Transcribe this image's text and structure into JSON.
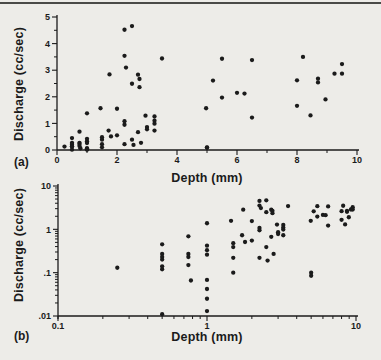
{
  "page": {
    "background": "#edece8",
    "ink": "#1b1b1b",
    "top_rule_color": "#4a4a47"
  },
  "measurements": [
    [
      0.25,
      0.13
    ],
    [
      0.5,
      0.45
    ],
    [
      0.5,
      0.27
    ],
    [
      0.5,
      0.23
    ],
    [
      0.5,
      0.2
    ],
    [
      0.5,
      0.14
    ],
    [
      0.5,
      0.12
    ],
    [
      0.5,
      0.011
    ],
    [
      0.75,
      0.69
    ],
    [
      0.75,
      0.27
    ],
    [
      0.75,
      0.23
    ],
    [
      0.75,
      0.15
    ],
    [
      0.78,
      0.066
    ],
    [
      1,
      1.38
    ],
    [
      1,
      0.42
    ],
    [
      1,
      0.33
    ],
    [
      1,
      0.26
    ],
    [
      1,
      0.068
    ],
    [
      1,
      0.042
    ],
    [
      1,
      0.025
    ],
    [
      1,
      0.013
    ],
    [
      1.45,
      1.57
    ],
    [
      1.5,
      0.48
    ],
    [
      1.5,
      0.39
    ],
    [
      1.5,
      0.22
    ],
    [
      1.5,
      0.1
    ],
    [
      1.75,
      2.84
    ],
    [
      1.72,
      0.73
    ],
    [
      1.8,
      0.51
    ],
    [
      2,
      1.55
    ],
    [
      2,
      0.55
    ],
    [
      2.25,
      4.52
    ],
    [
      2.25,
      3.54
    ],
    [
      2.3,
      3.1
    ],
    [
      2.25,
      1.08
    ],
    [
      2.25,
      0.95
    ],
    [
      2.25,
      0.22
    ],
    [
      2.5,
      4.66
    ],
    [
      2.5,
      2.49
    ],
    [
      2.5,
      0.39
    ],
    [
      2.55,
      0.19
    ],
    [
      2.7,
      2.83
    ],
    [
      2.75,
      2.67
    ],
    [
      2.75,
      2.36
    ],
    [
      2.7,
      0.67
    ],
    [
      2.8,
      0.27
    ],
    [
      2.95,
      1.29
    ],
    [
      3,
      0.86
    ],
    [
      3,
      0.78
    ],
    [
      3.25,
      1.26
    ],
    [
      3.25,
      1.1
    ],
    [
      3.25,
      0.99
    ],
    [
      3.25,
      0.73
    ],
    [
      3.5,
      3.44
    ],
    [
      4.97,
      1.57
    ],
    [
      5,
      0.1
    ],
    [
      5,
      0.085
    ],
    [
      5.2,
      2.61
    ],
    [
      5.5,
      3.43
    ],
    [
      5.5,
      1.97
    ],
    [
      6,
      2.15
    ],
    [
      6.25,
      2.12
    ],
    [
      6.5,
      3.38
    ],
    [
      6.5,
      1.22
    ],
    [
      8,
      2.62
    ],
    [
      8,
      1.66
    ],
    [
      8.2,
      3.5
    ],
    [
      8.45,
      1.3
    ],
    [
      8.7,
      2.68
    ],
    [
      8.7,
      2.54
    ],
    [
      8.95,
      1.9
    ],
    [
      9.25,
      2.87
    ],
    [
      9.5,
      3.23
    ],
    [
      9.5,
      2.87
    ]
  ],
  "chart_data": [
    {
      "id": "a",
      "type": "scatter",
      "panel_label": "(a)",
      "xlabel": "Depth (mm)",
      "ylabel": "Discharge (cc/sec)",
      "xscale": "linear",
      "yscale": "linear",
      "xlim": [
        0,
        10
      ],
      "ylim": [
        0,
        5
      ],
      "xticks": {
        "major": [
          0,
          2,
          4,
          6,
          8,
          10
        ],
        "labels": [
          "0",
          "2",
          "4",
          "6",
          "8",
          "10"
        ],
        "minor": [
          1,
          3,
          5,
          7,
          9
        ]
      },
      "yticks": {
        "major": [
          0,
          1,
          2,
          3,
          4,
          5
        ],
        "labels": [
          "0",
          "1",
          "2",
          "3",
          "4",
          "5"
        ],
        "minor": [
          0.5,
          1.5,
          2.5,
          3.5,
          4.5
        ]
      },
      "grid": false,
      "legend": "none",
      "marker": "filled-circle",
      "marker_color": "#1b1b1b",
      "points_source": "measurements"
    },
    {
      "id": "b",
      "type": "scatter",
      "panel_label": "(b)",
      "xlabel": "Depth (mm)",
      "ylabel": "Discharge (cc/sec)",
      "xscale": "log",
      "yscale": "log",
      "xlim": [
        0.1,
        10
      ],
      "ylim": [
        0.01,
        10
      ],
      "xticks": {
        "major": [
          0.1,
          1,
          10
        ],
        "labels": [
          "0.1",
          "1",
          "10"
        ],
        "minor": [
          0.2,
          0.3,
          0.4,
          0.5,
          0.6,
          0.7,
          0.8,
          0.9,
          2,
          3,
          4,
          5,
          6,
          7,
          8,
          9
        ]
      },
      "yticks": {
        "major": [
          10,
          1,
          0.1,
          0.01
        ],
        "labels": [
          "10",
          "1",
          ".1",
          ".01"
        ],
        "minor": [
          0.02,
          0.03,
          0.04,
          0.05,
          0.06,
          0.07,
          0.08,
          0.09,
          0.2,
          0.3,
          0.4,
          0.5,
          0.6,
          0.7,
          0.8,
          0.9,
          2,
          3,
          4,
          5,
          6,
          7,
          8,
          9
        ]
      },
      "grid": false,
      "legend": "none",
      "marker": "filled-circle",
      "marker_color": "#1b1b1b",
      "points_source": "measurements"
    }
  ]
}
